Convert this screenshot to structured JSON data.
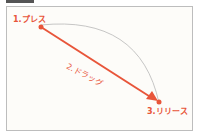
{
  "diagram": {
    "steps": [
      {
        "label": "1.プレス"
      },
      {
        "label": "2.ドラッグ"
      },
      {
        "label": "3.リリース"
      }
    ],
    "colors": {
      "accent": "#e8553a",
      "arc": "#b8b8b8",
      "frame": "#bdbdbd"
    }
  }
}
